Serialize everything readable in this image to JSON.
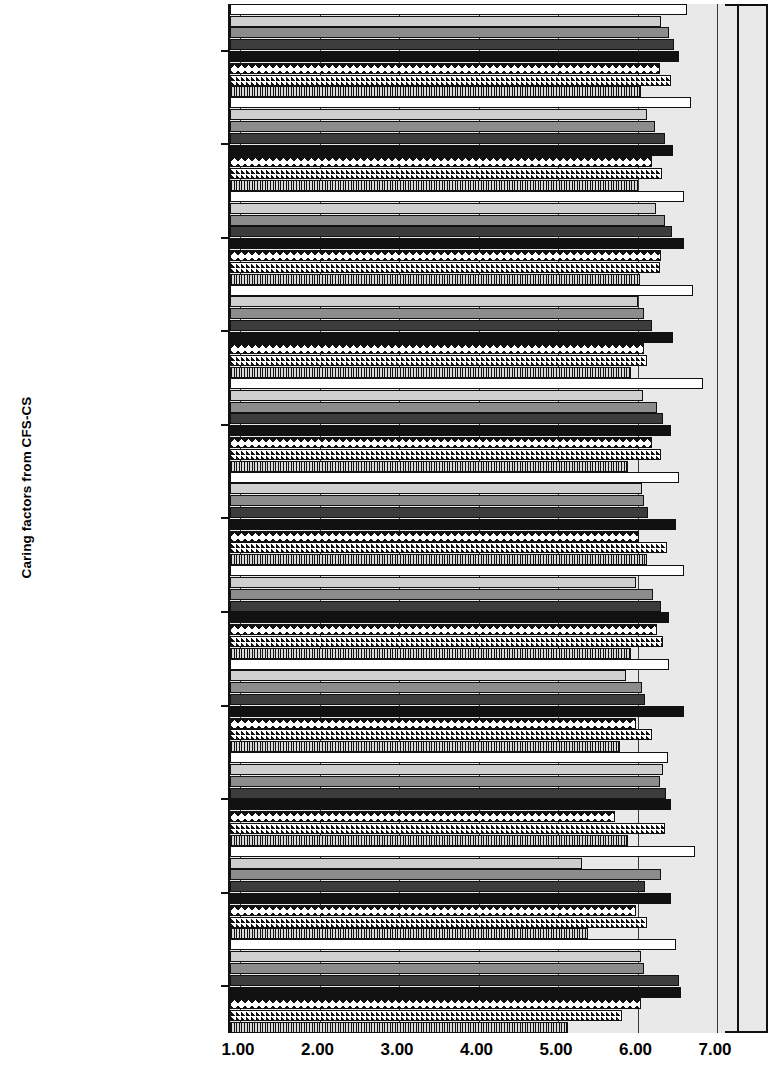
{
  "chart": {
    "type": "bar",
    "orientation": "horizontal",
    "ylabel": "Caring factors from CFS-CS",
    "xlabel": "",
    "title": "",
    "xlim": [
      1.0,
      7.0
    ],
    "xticks": [
      "1.00",
      "2.00",
      "3.00",
      "4.00",
      "5.00",
      "6.00",
      "7.00"
    ],
    "grid": true,
    "legend": "none"
  },
  "chart_data": {
    "type": "bar",
    "orientation": "horizontal",
    "title": "",
    "xlabel": "",
    "ylabel": "Caring factors from CFS-CS",
    "xlim": [
      1.0,
      7.0
    ],
    "xticks": [
      1.0,
      2.0,
      3.0,
      4.0,
      5.0,
      6.0,
      7.0
    ],
    "grid": true,
    "categories": [
      "Teaching and\nlearning",
      "Helping and trusting\nrelationship",
      "Instill faith\nand hope",
      "Decision making *",
      "Miracles *",
      "Healing\nenvironment *",
      "CFS-CS total *",
      "Promote expression\nof feelings *",
      "Spiritual beliefs\nand practices",
      "Holistic care *",
      "Practice loving\nkindness *"
    ],
    "series": [
      {
        "name": "series-1",
        "pattern": "solid-white",
        "values": [
          6.62,
          6.67,
          6.58,
          6.7,
          6.83,
          6.52,
          6.58,
          6.4,
          6.38,
          6.72,
          6.48
        ]
      },
      {
        "name": "series-2",
        "pattern": "solid-light-gray",
        "values": [
          6.3,
          6.12,
          6.23,
          6.0,
          6.07,
          6.06,
          5.98,
          5.85,
          6.32,
          5.3,
          6.05
        ]
      },
      {
        "name": "series-3",
        "pattern": "solid-medium-gray",
        "values": [
          6.4,
          6.22,
          6.35,
          6.08,
          6.24,
          6.08,
          6.2,
          6.06,
          6.28,
          6.3,
          6.08
        ]
      },
      {
        "name": "series-4",
        "pattern": "solid-dark-gray",
        "values": [
          6.46,
          6.35,
          6.43,
          6.18,
          6.32,
          6.13,
          6.3,
          6.1,
          6.36,
          6.1,
          6.52
        ]
      },
      {
        "name": "series-5",
        "pattern": "diamond-triangle",
        "values": [
          6.52,
          6.45,
          6.58,
          6.45,
          6.42,
          6.48,
          6.4,
          6.58,
          6.42,
          6.42,
          6.55
        ]
      },
      {
        "name": "series-6",
        "pattern": "diagonal-hatch",
        "values": [
          6.28,
          6.18,
          6.3,
          6.08,
          6.18,
          6.02,
          6.25,
          5.98,
          5.72,
          5.98,
          6.05
        ]
      },
      {
        "name": "series-7",
        "pattern": "vertical-hatch",
        "values": [
          6.42,
          6.31,
          6.28,
          6.12,
          6.3,
          6.37,
          6.32,
          6.18,
          6.34,
          6.12,
          5.8
        ]
      },
      {
        "name": "series-8",
        "pattern": "dotted",
        "values": [
          6.05,
          6.0,
          6.03,
          5.92,
          5.88,
          6.12,
          5.92,
          5.78,
          5.88,
          5.38,
          5.12
        ]
      }
    ]
  },
  "axis": {
    "tick_labels": [
      "1.00",
      "2.00",
      "3.00",
      "4.00",
      "5.00",
      "6.00",
      "7.00"
    ]
  }
}
